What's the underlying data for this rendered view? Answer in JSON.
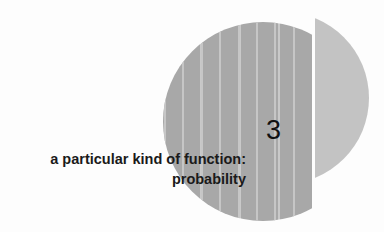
{
  "chapter": {
    "number": "3",
    "title_line1": "a particular kind of function:",
    "title_line2": "probability"
  },
  "colors": {
    "background": "#fdfdfd",
    "disc": "#a8a8a8",
    "stripes": "#c6c6c6",
    "segment": "#c3c3c3",
    "text": "#1a1a1a"
  }
}
